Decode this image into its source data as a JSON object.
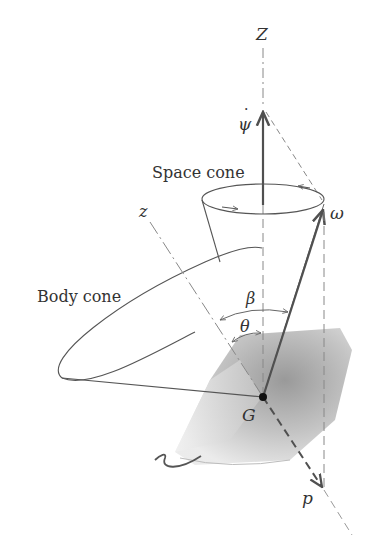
{
  "figure": {
    "type": "torque-free precession diagram",
    "labels": {
      "Z_axis": "Z",
      "psi_dot": "ψ",
      "space_cone": "Space cone",
      "body_cone": "Body cone",
      "z_axis": "z",
      "omega": "ω",
      "beta": "β",
      "theta": "θ",
      "center_of_mass": "G",
      "p_axis": "p"
    },
    "colors": {
      "line": "#555555",
      "arrow": "#505050",
      "dash": "#888888",
      "body_light": "#e6e6e6",
      "body_dark": "#9a9a9a",
      "text": "#333333"
    }
  }
}
